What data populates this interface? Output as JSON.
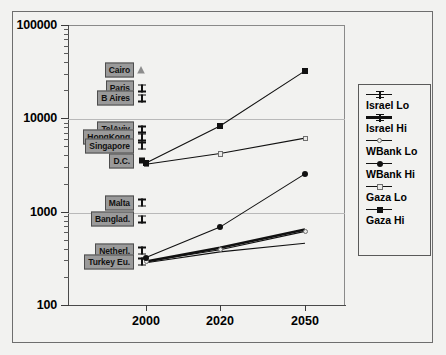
{
  "chart_data": {
    "type": "line",
    "title": "",
    "xlabel": "",
    "ylabel": "",
    "x": [
      2000,
      2020,
      2050
    ],
    "xtick_labels": [
      "2000",
      "2020",
      "2050"
    ],
    "ytick_labels": [
      "100",
      "1000",
      "10000",
      "100000"
    ],
    "ylim": [
      100,
      100000
    ],
    "yscale": "log",
    "grid": true,
    "legend_position": "right-outside",
    "series": [
      {
        "name": "Israel Lo",
        "marker": "ibeam-line",
        "line": "thin",
        "values": [
          290,
          380,
          470
        ]
      },
      {
        "name": "Israel Hi",
        "marker": "ibeam-thick",
        "line": "thick",
        "values": [
          300,
          420,
          660
        ]
      },
      {
        "name": "WBank Lo",
        "marker": "open-circle",
        "line": "thin",
        "values": [
          300,
          400,
          630
        ]
      },
      {
        "name": "WBank Hi",
        "marker": "filled-circle",
        "line": "thin",
        "values": [
          330,
          700,
          2600
        ]
      },
      {
        "name": "Gaza Lo",
        "marker": "open-square",
        "line": "thin",
        "values": [
          3300,
          4300,
          6300
        ]
      },
      {
        "name": "Gaza Hi",
        "marker": "filled-square",
        "line": "thin",
        "values": [
          3400,
          8500,
          33000
        ]
      }
    ],
    "reference_labels": [
      {
        "label": "Cairo",
        "value": 33000,
        "marker": "open-triangle"
      },
      {
        "label": "Paris",
        "value": 21000,
        "marker": "ibeam"
      },
      {
        "label": "B Aires",
        "value": 16500,
        "marker": "ibeam"
      },
      {
        "label": "TelAviv",
        "value": 7600,
        "marker": "ibeam"
      },
      {
        "label": "HongKong",
        "value": 6300,
        "marker": "ibeam"
      },
      {
        "label": "Singapore",
        "value": 5100,
        "marker": "ibeam"
      },
      {
        "label": "D.C.",
        "value": 3500,
        "marker": "filled-square"
      },
      {
        "label": "Malta",
        "value": 1250,
        "marker": "ibeam"
      },
      {
        "label": "Banglad.",
        "value": 830,
        "marker": "ibeam"
      },
      {
        "label": "Netherl.",
        "value": 380,
        "marker": "ibeam"
      },
      {
        "label": "Turkey Eu.",
        "value": 290,
        "marker": "ibeam"
      }
    ]
  },
  "legend": {
    "items": [
      {
        "label": "Israel Lo"
      },
      {
        "label": "Israel Hi"
      },
      {
        "label": "WBank Lo"
      },
      {
        "label": "WBank Hi"
      },
      {
        "label": "Gaza Lo"
      },
      {
        "label": "Gaza Hi"
      }
    ]
  },
  "colors": {
    "background": "#f2f2f0",
    "frame": "#6e6e6e",
    "axis": "#4a4a4a",
    "gridline": "#b9b9b9",
    "series": "#111111",
    "label_box": "#9a9a9a"
  }
}
